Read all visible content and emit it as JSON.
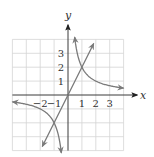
{
  "chart_data": {
    "type": "line",
    "title": "",
    "xlabel": "x",
    "ylabel": "y",
    "xlim": [
      -4,
      4
    ],
    "ylim": [
      -4,
      4
    ],
    "grid": true,
    "x_tick_labels": [
      "−2",
      "−1",
      "1",
      "2",
      "3"
    ],
    "x_ticks": [
      -2,
      -1,
      1,
      2,
      3
    ],
    "y_tick_labels": [
      "1",
      "2",
      "3"
    ],
    "y_ticks": [
      1,
      2,
      3
    ],
    "series": [
      {
        "name": "line y = 2x",
        "kind": "line",
        "points": [
          [
            -1.85,
            -3.7
          ],
          [
            0,
            0
          ],
          [
            1.85,
            3.7
          ]
        ]
      },
      {
        "name": "hyperbola y = 2/x (branch 1)",
        "kind": "curve",
        "domain": [
          0.48,
          4.0
        ]
      },
      {
        "name": "hyperbola y = 2/x (branch 3)",
        "kind": "curve",
        "domain": [
          -4.0,
          -0.48
        ]
      }
    ],
    "intersections": [
      [
        1,
        2
      ],
      [
        -1,
        -2
      ]
    ],
    "colors": {
      "curve": "#7a7a7a",
      "grid": "#d4d4d4",
      "axis": "#3a3a3a"
    }
  }
}
